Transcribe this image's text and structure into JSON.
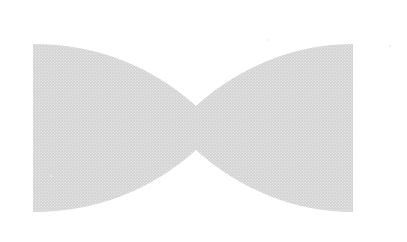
{
  "image": {
    "width": 407,
    "height": 242,
    "background_color": "#ffffff",
    "title": "Bowtie silhouette"
  },
  "shape": {
    "name": "bowtie",
    "alt_names": [
      "hourglass",
      "ribbon",
      "butterfly"
    ],
    "fill_color": "#d2d2d2",
    "texture": "halftone-dither-dots",
    "texture_dot_color": "#ffffff",
    "texture_spacing_px": 3,
    "texture_dot_radius_px": 0.55,
    "edge_softness_px": 0.8,
    "geometry": {
      "left_edge_x": 33,
      "right_edge_x": 353,
      "top_y": 44,
      "bottom_y": 212,
      "waist_center_x": 196,
      "waist_top_y": 113,
      "waist_bottom_y": 150,
      "waist_height": 37,
      "lobe_height": 168,
      "total_width": 320,
      "symmetry": "horizontal-and-vertical"
    },
    "path": "M 33 44 L 33 212 C 96 212 152 190 196 150 C 240 190 296 212 353 212 L 353 44 C 296 44 240 66 196 106 C 152 66 96 44 33 44 Z"
  },
  "specks": [
    {
      "name": "speck-top-right",
      "x": 390,
      "y": 46,
      "size": 2.2,
      "color": "#ededed"
    },
    {
      "name": "speck-left-mid",
      "x": 51,
      "y": 176,
      "size": 2.0,
      "color": "#f0f0f0"
    },
    {
      "name": "speck-upper-mid",
      "x": 268,
      "y": 40,
      "size": 1.8,
      "color": "#f2f2f2"
    }
  ]
}
